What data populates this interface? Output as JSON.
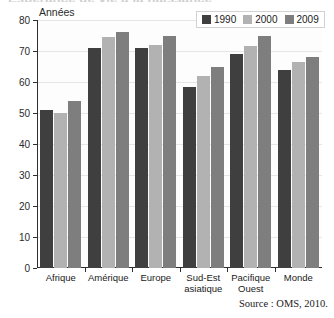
{
  "figure": {
    "title_cut_off": "Espérance de vie à la naissance",
    "source_note": "Source : OMS, 2010."
  },
  "chart_data": {
    "type": "bar",
    "title": "",
    "xlabel": "",
    "ylabel": "Années",
    "ylim": [
      0,
      80
    ],
    "yticks": [
      0,
      10,
      20,
      30,
      40,
      50,
      60,
      70,
      80
    ],
    "grid": true,
    "legend_position": "top-right",
    "categories": [
      "Afrique",
      "Amérique",
      "Europe",
      "Sud-Est asiatique",
      "Pacifique Ouest",
      "Monde"
    ],
    "category_lines": [
      [
        "Afrique"
      ],
      [
        "Amérique"
      ],
      [
        "Europe"
      ],
      [
        "Sud-Est",
        "asiatique"
      ],
      [
        "Pacifique",
        "Ouest"
      ],
      [
        "Monde"
      ]
    ],
    "series": [
      {
        "name": "1990",
        "color": "#3f3f3f",
        "values": [
          51,
          71,
          71,
          58.5,
          69,
          64
        ]
      },
      {
        "name": "2000",
        "color": "#b2b2b2",
        "values": [
          50,
          74.5,
          72,
          62,
          71.5,
          66.5
        ]
      },
      {
        "name": "2009",
        "color": "#7e7e7e",
        "values": [
          54,
          76,
          75,
          65,
          75,
          68
        ]
      }
    ]
  }
}
